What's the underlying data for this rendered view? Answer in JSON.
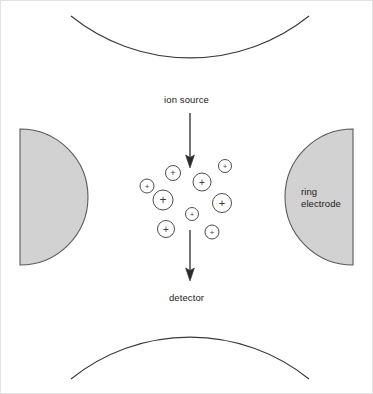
{
  "figure": {
    "background_color": "#ffffff",
    "border_color": "#e2e2e2",
    "line_color": "#3a3a3a",
    "electrode_fill": "#d2d2d2",
    "electrode_stroke": "#5a5a5a",
    "text_color": "#1a1a1a"
  },
  "labels": {
    "ion_source": "ion source",
    "detector": "detector",
    "ring_electrode_line1": "ring",
    "ring_electrode_line2": "electrode"
  },
  "arrows": [
    {
      "name": "ion-source-arrow",
      "x": 190,
      "y1": 113,
      "y2": 167,
      "direction": "down"
    },
    {
      "name": "detector-arrow",
      "x": 190,
      "y1": 230,
      "y2": 280,
      "direction": "down"
    }
  ],
  "endcap_electrodes": [
    {
      "name": "top-endcap",
      "cx": 190,
      "cy": -57,
      "r": 190,
      "orientation": "convex-down",
      "apex_y": 133
    },
    {
      "name": "bottom-endcap",
      "cx": 190,
      "cy": 458,
      "r": 190,
      "orientation": "convex-up",
      "apex_y": 268
    }
  ],
  "ring_electrodes": [
    {
      "name": "left-ring-electrode",
      "flat_x": 20,
      "cy": 197,
      "r": 68,
      "bulge": "right"
    },
    {
      "name": "right-ring-electrode",
      "flat_x": 353,
      "cy": 197,
      "r": 68,
      "bulge": "left"
    }
  ],
  "ions": [
    {
      "cx": 147,
      "cy": 186,
      "r": 7.0,
      "charge": "+"
    },
    {
      "cx": 173,
      "cy": 173,
      "r": 7.5,
      "charge": "+"
    },
    {
      "cx": 163,
      "cy": 200,
      "r": 10.0,
      "charge": "+"
    },
    {
      "cx": 166,
      "cy": 229,
      "r": 8.5,
      "charge": "+"
    },
    {
      "cx": 192,
      "cy": 214,
      "r": 6.5,
      "charge": "+"
    },
    {
      "cx": 202,
      "cy": 182,
      "r": 9.0,
      "charge": "+"
    },
    {
      "cx": 225,
      "cy": 166,
      "r": 6.5,
      "charge": "+"
    },
    {
      "cx": 222,
      "cy": 203,
      "r": 9.5,
      "charge": "+"
    },
    {
      "cx": 212,
      "cy": 232,
      "r": 7.0,
      "charge": "+"
    }
  ]
}
